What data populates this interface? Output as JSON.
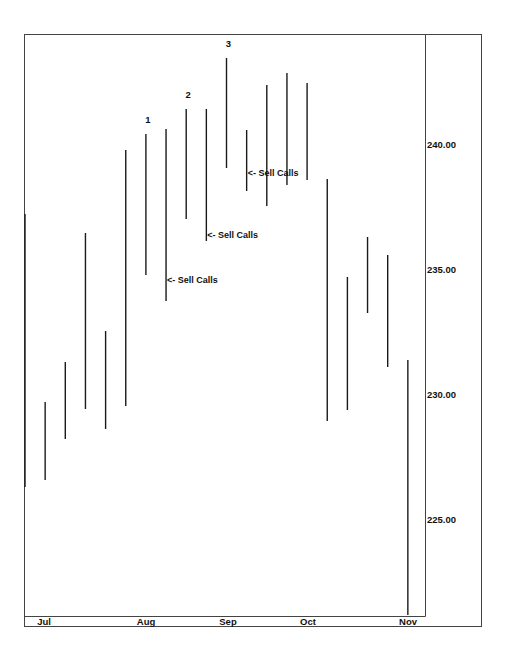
{
  "chart_data": {
    "type": "bar",
    "subtype": "ohlc-high-low",
    "title": "",
    "xlabel": "",
    "ylabel": "",
    "ylim": [
      220.6,
      243.96
    ],
    "y_axis_position": "right",
    "y_ticks": [
      {
        "value": 240.0,
        "label": "240.00"
      },
      {
        "value": 235.0,
        "label": "235.00"
      },
      {
        "value": 230.0,
        "label": "230.00"
      },
      {
        "value": 225.0,
        "label": "225.00"
      }
    ],
    "x_ticks": [
      {
        "label": "Jul",
        "x": 44
      },
      {
        "label": "Aug",
        "x": 146
      },
      {
        "label": "Sep",
        "x": 228
      },
      {
        "label": "Oct",
        "x": 308
      },
      {
        "label": "Nov",
        "x": 408
      }
    ],
    "grid": false,
    "legend": null,
    "bars": [
      {
        "i": 1,
        "high": 237.24,
        "low": 226.32
      },
      {
        "i": 2,
        "high": 229.72,
        "low": 226.6
      },
      {
        "i": 3,
        "high": 231.32,
        "low": 228.24
      },
      {
        "i": 4,
        "high": 236.48,
        "low": 229.44
      },
      {
        "i": 5,
        "high": 232.56,
        "low": 228.64
      },
      {
        "i": 6,
        "high": 239.8,
        "low": 229.56
      },
      {
        "i": 7,
        "high": 240.44,
        "low": 234.8
      },
      {
        "i": 8,
        "high": 240.64,
        "low": 233.76
      },
      {
        "i": 9,
        "high": 241.44,
        "low": 237.04
      },
      {
        "i": 10,
        "high": 241.44,
        "low": 236.16
      },
      {
        "i": 11,
        "high": 243.48,
        "low": 239.08
      },
      {
        "i": 12,
        "high": 240.6,
        "low": 238.16
      },
      {
        "i": 13,
        "high": 242.4,
        "low": 237.56
      },
      {
        "i": 14,
        "high": 242.88,
        "low": 238.4
      },
      {
        "i": 15,
        "high": 242.48,
        "low": 238.6
      },
      {
        "i": 16,
        "high": 238.64,
        "low": 228.96
      },
      {
        "i": 17,
        "high": 234.72,
        "low": 229.4
      },
      {
        "i": 18,
        "high": 236.32,
        "low": 233.28
      },
      {
        "i": 19,
        "high": 235.6,
        "low": 231.12
      },
      {
        "i": 20,
        "high": 231.4,
        "low": 221.2
      }
    ],
    "annotations": [
      {
        "text": "1",
        "bar": 7,
        "position": "above"
      },
      {
        "text": "2",
        "bar": 9,
        "position": "above"
      },
      {
        "text": "3",
        "bar": 11,
        "position": "above"
      },
      {
        "text": "<- Sell Calls",
        "bar": 8,
        "price": 234.6
      },
      {
        "text": "<- Sell Calls",
        "bar": 10,
        "price": 236.4
      },
      {
        "text": "<- Sell Calls",
        "bar": 12,
        "price": 238.9
      }
    ]
  }
}
